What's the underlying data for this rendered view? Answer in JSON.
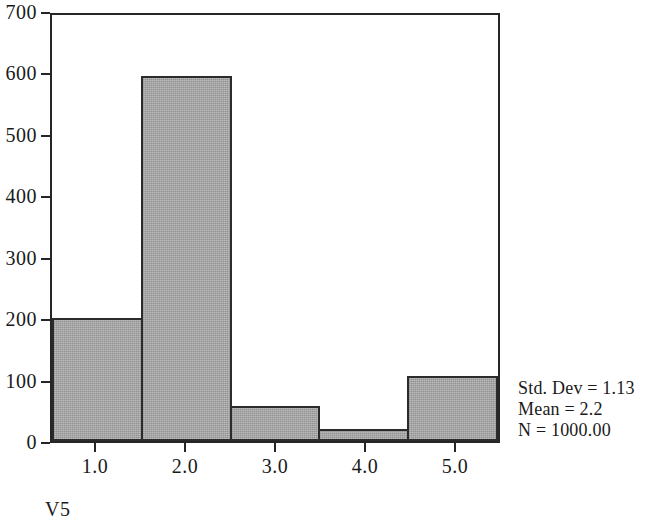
{
  "chart_data": {
    "type": "bar",
    "title": "",
    "subtitle": "",
    "xlabel": "V5",
    "ylabel": "",
    "categories": [
      "1.0",
      "2.0",
      "3.0",
      "4.0",
      "5.0"
    ],
    "values": [
      202,
      600,
      58,
      20,
      107
    ],
    "xlim": [
      0.5,
      5.5
    ],
    "ylim": [
      0,
      700
    ],
    "y_ticks": [
      0,
      100,
      200,
      300,
      400,
      500,
      600,
      700
    ],
    "y_tick_labels": [
      "0",
      "100",
      "200",
      "300",
      "400",
      "500",
      "600",
      "700"
    ],
    "x_ticks": [
      1.0,
      2.0,
      3.0,
      4.0,
      5.0
    ],
    "x_tick_labels": [
      "1.0",
      "2.0",
      "3.0",
      "4.0",
      "5.0"
    ],
    "grid": false,
    "legend": null,
    "bar_fill_color": "#9b9b9b",
    "bar_edge_color": "#2b2b2b",
    "axis_color": "#262626",
    "background_color": "#ffffff",
    "annotations": [
      "Std. Dev = 1.13",
      "Mean = 2.2",
      "N = 1000.00"
    ]
  },
  "stats": {
    "std_dev": "Std. Dev = 1.13",
    "mean": "Mean = 2.2",
    "n": "N = 1000.00"
  },
  "axis": {
    "x_title": "V5"
  }
}
